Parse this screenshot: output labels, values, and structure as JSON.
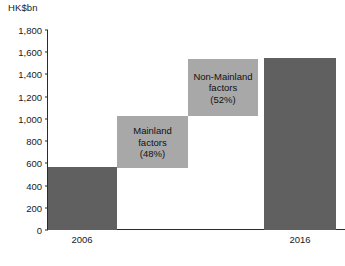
{
  "chart_data": {
    "type": "bar",
    "title": "",
    "subtitle": "",
    "unit_caption": "HK$bn",
    "xlabel": "",
    "ylabel": "HK$bn",
    "ylim": [
      0,
      1800
    ],
    "grid": false,
    "legend": "none",
    "orientation": "vertical",
    "waterfall": true,
    "categories": [
      "2006",
      "Mainland factors",
      "Non-Mainland factors",
      "2016"
    ],
    "values": [
      560,
      480,
      520,
      1600
    ],
    "yticks": [
      "0",
      "200",
      "400",
      "600",
      "800",
      "1,000",
      "1,200",
      "1,400",
      "1,600",
      "1,800"
    ],
    "ytick_values": [
      0,
      200,
      400,
      600,
      800,
      1000,
      1200,
      1400,
      1600,
      1800
    ],
    "xtick_labels": [
      "2006",
      "2016"
    ],
    "colors": {
      "total_bar": "#606060",
      "component_bar": "#a8a8a8",
      "axis": "#2b2b2b",
      "text": "#1a1a1a",
      "background": "#ffffff"
    },
    "series": [
      {
        "name": "2006 total",
        "kind": "total",
        "label": "",
        "label_lines": [],
        "value": 560,
        "base": 0,
        "top": 560,
        "color": "#606060"
      },
      {
        "name": "Mainland factors",
        "kind": "increment",
        "label": "Mainland factors (48%)",
        "label_lines": [
          "Mainland",
          "factors",
          "(48%)"
        ],
        "value": 480,
        "base": 560,
        "top": 1040,
        "share_pct": 48,
        "color": "#a8a8a8"
      },
      {
        "name": "Non-Mainland factors",
        "kind": "increment",
        "label": "Non-Mainland factors (52%)",
        "label_lines": [
          "Non-Mainland",
          "factors",
          "(52%)"
        ],
        "value": 520,
        "base": 1040,
        "top": 1560,
        "share_pct": 52,
        "color": "#a8a8a8"
      },
      {
        "name": "2016 total",
        "kind": "total",
        "label": "",
        "label_lines": [],
        "value": 1600,
        "base": 0,
        "top": 1600,
        "color": "#606060"
      }
    ]
  },
  "axis": {
    "unit_caption": "HK$bn",
    "yticks": [
      {
        "label": "1,800",
        "value": 1800
      },
      {
        "label": "1,600",
        "value": 1600
      },
      {
        "label": "1,400",
        "value": 1400
      },
      {
        "label": "1,200",
        "value": 1200
      },
      {
        "label": "1,000",
        "value": 1000
      },
      {
        "label": "800",
        "value": 800
      },
      {
        "label": "600",
        "value": 600
      },
      {
        "label": "400",
        "value": 400
      },
      {
        "label": "200",
        "value": 200
      },
      {
        "label": "0",
        "value": 0
      }
    ],
    "xticks": [
      {
        "label": "2006"
      },
      {
        "label": "2016"
      }
    ]
  },
  "blocks": {
    "bar_2006": {
      "label": ""
    },
    "mainland": {
      "line1": "Mainland",
      "line2": "factors",
      "line3": "(48%)"
    },
    "non_mainland": {
      "line1": "Non-Mainland",
      "line2": "factors",
      "line3": "(52%)"
    },
    "bar_2016": {
      "label": ""
    }
  }
}
